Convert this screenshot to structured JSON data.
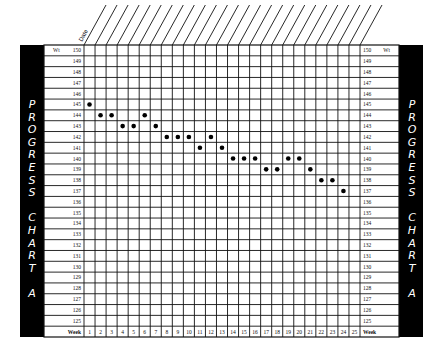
{
  "sidebar_left": {
    "letters": [
      "P",
      "R",
      "O",
      "G",
      "R",
      "E",
      "S",
      "S",
      "",
      "C",
      "H",
      "A",
      "R",
      "T",
      "",
      "A"
    ]
  },
  "sidebar_right": {
    "letters": [
      "P",
      "R",
      "O",
      "G",
      "R",
      "E",
      "S",
      "S",
      "",
      "C",
      "H",
      "A",
      "R",
      "T",
      "",
      "A"
    ]
  },
  "header": {
    "date_label": "Date"
  },
  "axis": {
    "weight_label": "Wt",
    "week_label": "Week",
    "weights": [
      150,
      149,
      148,
      147,
      146,
      145,
      144,
      143,
      142,
      141,
      140,
      139,
      138,
      137,
      136,
      135,
      134,
      133,
      132,
      131,
      130,
      129,
      128,
      127,
      126,
      125
    ],
    "weeks": [
      1,
      2,
      3,
      4,
      5,
      6,
      7,
      8,
      9,
      10,
      11,
      12,
      13,
      14,
      15,
      16,
      17,
      18,
      19,
      20,
      21,
      22,
      23,
      24,
      25
    ]
  },
  "colors": {
    "bar": "#000000",
    "grid": "#111111",
    "dot": "#000000",
    "background": "#ffffff"
  },
  "chart_data": {
    "type": "scatter",
    "xlabel": "Week",
    "ylabel": "Wt",
    "x": [
      1,
      2,
      3,
      4,
      5,
      6,
      7,
      8,
      9,
      10,
      11,
      12,
      13,
      14,
      15,
      16,
      17,
      18,
      19,
      20,
      21,
      22,
      23,
      24
    ],
    "y": [
      145,
      144,
      144,
      143,
      143,
      144,
      143,
      142,
      142,
      142,
      141,
      142,
      141,
      140,
      140,
      140,
      139,
      139,
      140,
      140,
      139,
      138,
      138,
      137
    ],
    "xlim": [
      1,
      25
    ],
    "ylim": [
      125,
      150
    ],
    "grid": true,
    "header_row_label": "Date"
  }
}
